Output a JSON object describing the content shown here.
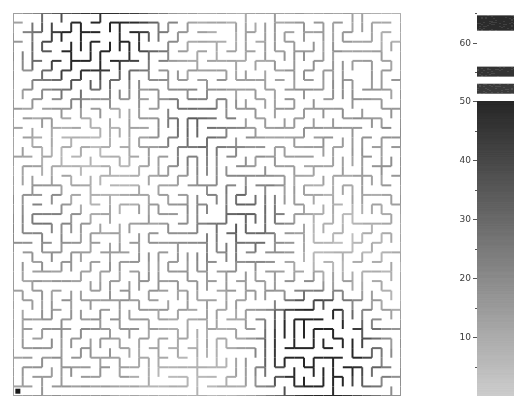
{
  "figure": {
    "title": "",
    "background_color": "#ffffff",
    "width": 527,
    "height": 407
  },
  "maze": {
    "name": "maze-wall-heatmap",
    "description": "Square maze drawn as horizontal and vertical wall segments shaded by value",
    "grid_cols": 40,
    "grid_rows": 40,
    "cell_px": 9.6,
    "wall_thickness_px": 2,
    "start_marker": {
      "label": "start-dot",
      "x_cell": 0,
      "y_cell": 39,
      "color": "#1a1a1a",
      "size_px": 5
    },
    "bounds": {
      "left": 13,
      "top": 13,
      "width": 388,
      "height": 383
    },
    "seed": 20240517
  },
  "colorbar": {
    "name": "value-colorbar",
    "orientation": "vertical",
    "vmin": 0,
    "vmax": 50,
    "cmap": "gray_r",
    "low_color": "#c9c9c9",
    "high_color": "#4a4a4a",
    "over_color": "#2b2b2b",
    "bounds": {
      "left": 477,
      "top": 13,
      "width": 37,
      "height": 383
    },
    "continuous_top_value": 50,
    "axis_top_value": 65,
    "tick_values": [
      10,
      20,
      30,
      40,
      50,
      60
    ],
    "tick_labels": [
      "10",
      "20",
      "30",
      "40",
      "50",
      "60"
    ],
    "minor_tick_values": [
      5,
      15,
      25,
      35,
      45,
      55,
      65
    ],
    "discrete_bands": [
      {
        "from": 51.3,
        "to": 53.0,
        "color": "#3a3a3a"
      },
      {
        "from": 54.2,
        "to": 55.9,
        "color": "#333333"
      },
      {
        "from": 62.0,
        "to": 64.6,
        "color": "#2b2b2b"
      }
    ]
  },
  "chart_data": {
    "type": "heatmap",
    "title": "",
    "xlabel": "",
    "ylabel": "",
    "legend_position": "right",
    "grid": false,
    "colorbar_label": "",
    "colorbar_ticks": [
      10,
      20,
      30,
      40,
      50,
      60
    ],
    "colorbar_range": [
      0,
      65
    ],
    "value_min": 0,
    "value_max": 65,
    "note": "Wall segments of a 40x40 maze shaded by scalar value; colorbar is grayscale, dark = high"
  }
}
